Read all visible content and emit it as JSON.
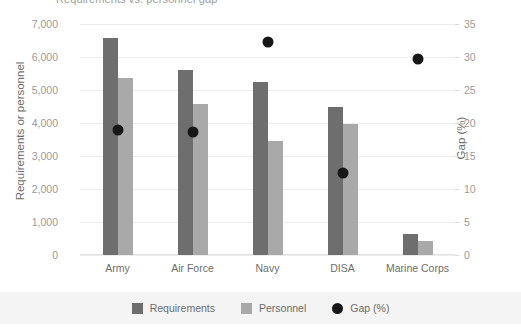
{
  "title_clipped": "Requirements vs. personnel gap",
  "chart_data": {
    "type": "bar",
    "title": "Requirements vs. personnel gap",
    "xlabel": "",
    "ylabel": "Requirements or personnel",
    "y2label": "Gap (%)",
    "ylim": [
      0,
      7000
    ],
    "y2lim": [
      0,
      35
    ],
    "grid": true,
    "legend_position": "bottom",
    "categories": [
      "Army",
      "Air Force",
      "Navy",
      "DISA",
      "Marine Corps"
    ],
    "yticks": [
      "0",
      "1,000",
      "2,000",
      "3,000",
      "4,000",
      "5,000",
      "6,000",
      "7,000"
    ],
    "y2ticks": [
      "0",
      "5",
      "10",
      "15",
      "20",
      "25",
      "30",
      "35"
    ],
    "series": [
      {
        "name": "Requirements",
        "axis": "left",
        "kind": "bar",
        "color": "#6e6e6e",
        "values": [
          6580,
          5600,
          5240,
          4490,
          630
        ]
      },
      {
        "name": "Personnel",
        "axis": "left",
        "kind": "bar",
        "color": "#a9a9a9",
        "values": [
          5360,
          4570,
          3450,
          3970,
          420
        ]
      },
      {
        "name": "Gap (%)",
        "axis": "right",
        "kind": "scatter",
        "color": "#171717",
        "values": [
          18.9,
          18.6,
          32.3,
          12.4,
          29.7
        ]
      }
    ]
  },
  "legend": {
    "items": [
      {
        "label": "Requirements",
        "color": "#6e6e6e",
        "shape": "square"
      },
      {
        "label": "Personnel",
        "color": "#a9a9a9",
        "shape": "square"
      },
      {
        "label": "Gap (%)",
        "color": "#171717",
        "shape": "circle"
      }
    ]
  }
}
